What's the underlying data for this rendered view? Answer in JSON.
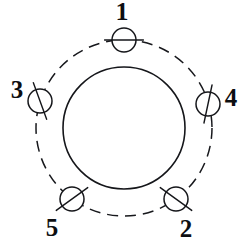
{
  "drawing": {
    "title": "Bolt circle hole pattern",
    "background_color": "#ffffff",
    "line_color": "#15161a",
    "canvas": {
      "width": 249,
      "height": 249
    },
    "center": {
      "x": 124,
      "y": 128
    },
    "bore": {
      "name": "central bore circle",
      "style": "solid",
      "radius": 61,
      "stroke_width": 1.6
    },
    "bolt_circle": {
      "name": "bolt circle centerline",
      "style": "dashed",
      "radius": 88,
      "stroke_width": 1.5,
      "dash_pattern": "11 7"
    },
    "hole_radius": 12,
    "holes": [
      {
        "label": "1",
        "angle_deg": 90,
        "cx": 124,
        "cy": 40,
        "tick_angle_deg": 0,
        "label_x": 122,
        "label_y": 14,
        "label_anchor": "middle"
      },
      {
        "label": "4",
        "angle_deg": 16,
        "cx": 208,
        "cy": 104,
        "tick_angle_deg": 78,
        "label_x": 231,
        "label_y": 100,
        "label_anchor": "middle"
      },
      {
        "label": "2",
        "angle_deg": -54,
        "cx": 176,
        "cy": 199,
        "tick_angle_deg": -36,
        "label_x": 186,
        "label_y": 231,
        "label_anchor": "middle"
      },
      {
        "label": "5",
        "angle_deg": -126,
        "cx": 72,
        "cy": 199,
        "tick_angle_deg": 36,
        "label_x": 52,
        "label_y": 230,
        "label_anchor": "middle"
      },
      {
        "label": "3",
        "angle_deg": 162,
        "cx": 40,
        "cy": 101,
        "tick_angle_deg": -70,
        "label_x": 17,
        "label_y": 92,
        "label_anchor": "middle"
      }
    ]
  }
}
